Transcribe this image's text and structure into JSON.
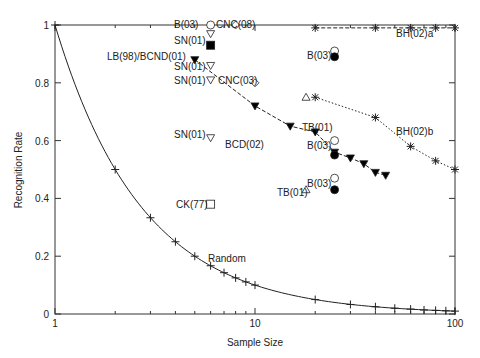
{
  "chart_data": {
    "type": "scatter",
    "title": "",
    "xlabel": "Sample Size",
    "ylabel": "Recognition Rate",
    "xscale": "log",
    "xlim": [
      1,
      100
    ],
    "ylim": [
      0,
      1
    ],
    "xticks": [
      "1",
      "10",
      "100"
    ],
    "yticks": [
      "0",
      "0.2",
      "0.4",
      "0.6",
      "0.8",
      "1"
    ],
    "grid": false,
    "legend": "none (inline point labels)",
    "series": [
      {
        "name": "Random",
        "style": "solid line with + markers",
        "x": [
          1,
          2,
          3,
          4,
          5,
          6,
          7,
          8,
          9,
          10,
          20,
          30,
          40,
          50,
          60,
          70,
          80,
          90,
          100
        ],
        "y": [
          1,
          0.5,
          0.333,
          0.25,
          0.2,
          0.167,
          0.143,
          0.125,
          0.111,
          0.1,
          0.05,
          0.033,
          0.025,
          0.02,
          0.017,
          0.014,
          0.0125,
          0.011,
          0.01
        ]
      },
      {
        "name": "BH(02)a",
        "style": "dashed line with star markers",
        "x": [
          20,
          40,
          60,
          80,
          100
        ],
        "y": [
          0.99,
          0.99,
          0.99,
          0.99,
          0.99
        ]
      },
      {
        "name": "BH(02)b",
        "style": "dotted line with star markers",
        "x": [
          20,
          40,
          60,
          80,
          100
        ],
        "y": [
          0.75,
          0.68,
          0.58,
          0.53,
          0.5
        ]
      },
      {
        "name": "BCD(02)",
        "style": "dashed line with filled down-triangles",
        "x": [
          5,
          10,
          15,
          20,
          25,
          30,
          35,
          40,
          45
        ],
        "y": [
          0.88,
          0.72,
          0.65,
          0.63,
          0.56,
          0.54,
          0.52,
          0.49,
          0.48
        ]
      },
      {
        "name": "B(03)",
        "style": "open/filled circles",
        "points": [
          {
            "x": 6,
            "y": 1.0,
            "open": true
          },
          {
            "x": 25,
            "y": 0.91,
            "open": true
          },
          {
            "x": 25,
            "y": 0.89,
            "open": false
          },
          {
            "x": 25,
            "y": 0.6,
            "open": true
          },
          {
            "x": 25,
            "y": 0.55,
            "open": false
          },
          {
            "x": 25,
            "y": 0.47,
            "open": true
          },
          {
            "x": 25,
            "y": 0.43,
            "open": false
          }
        ]
      },
      {
        "name": "CNC(08)",
        "marker": "open diamond",
        "points": [
          {
            "x": 8,
            "y": 1.0
          }
        ]
      },
      {
        "name": "CNC(03)",
        "marker": "open diamond",
        "points": [
          {
            "x": 10,
            "y": 0.8
          }
        ]
      },
      {
        "name": "SN(01)",
        "marker": "open down-triangle",
        "points": [
          {
            "x": 6,
            "y": 0.97
          },
          {
            "x": 6,
            "y": 0.86
          },
          {
            "x": 6,
            "y": 0.81
          },
          {
            "x": 6,
            "y": 0.61
          }
        ]
      },
      {
        "name": "LB(98)/BCND(01)",
        "marker": "filled square",
        "points": [
          {
            "x": 6,
            "y": 0.93
          }
        ]
      },
      {
        "name": "TB(01)",
        "marker": "open triangle",
        "points": [
          {
            "x": 18,
            "y": 0.75
          },
          {
            "x": 18,
            "y": 0.43
          }
        ]
      },
      {
        "name": "CK(77)",
        "marker": "open square",
        "points": [
          {
            "x": 6,
            "y": 0.38
          }
        ]
      }
    ]
  },
  "labels": {
    "random": "Random",
    "bh02a": "BH(02)a",
    "bh02b": "BH(02)b",
    "bcd02": "BCD(02)",
    "b03": "B(03)",
    "cnc08": "CNC(08)",
    "cnc03": "CNC(03)",
    "sn01": "SN(01)",
    "lb98": "LB(98)/BCND(01)",
    "tb01": "TB(01)",
    "ck77": "CK(77)"
  }
}
